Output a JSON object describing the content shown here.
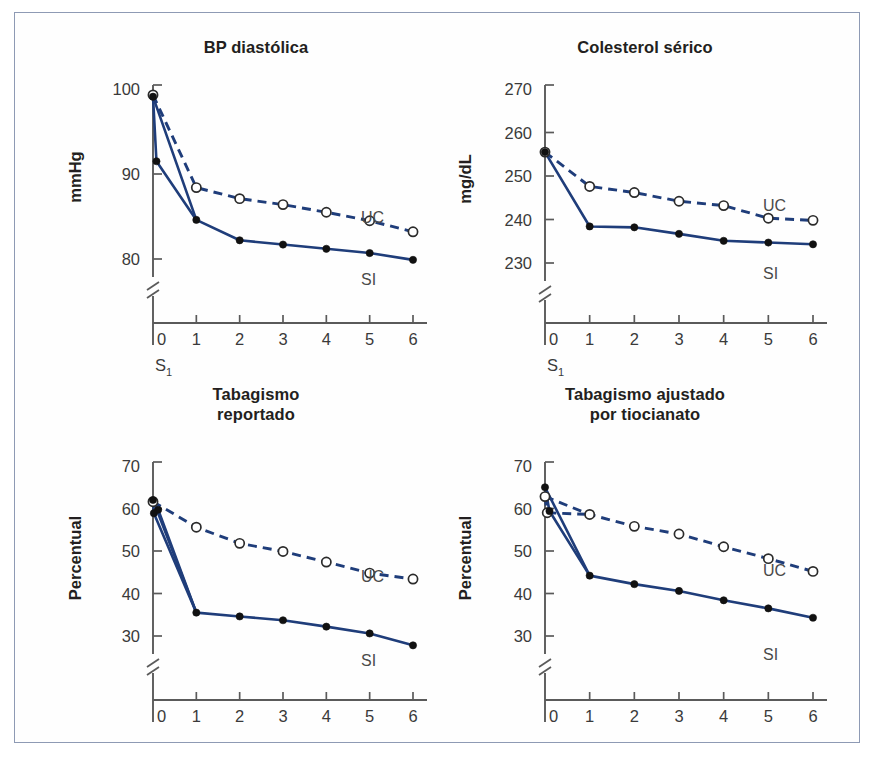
{
  "figure": {
    "background": "#ffffff",
    "border_color": "#8e9ab4",
    "line_color": "#1f3d7a",
    "panels": [
      "top_left",
      "top_right",
      "bottom_left",
      "bottom_right"
    ]
  },
  "chart_data": [
    {
      "id": "bp-diastolica",
      "type": "line",
      "title": "BP diastólica",
      "xlabel": "",
      "ylabel": "mmHg",
      "x": [
        0,
        1,
        2,
        3,
        4,
        5,
        6
      ],
      "xticklabels": [
        "0",
        "1",
        "2",
        "3",
        "4",
        "5",
        "6"
      ],
      "x_origin_note": "S1",
      "yticklabels": [
        "80",
        "90",
        "100"
      ],
      "yticks": [
        80,
        90,
        100
      ],
      "ylim": [
        77,
        101
      ],
      "axis_break": true,
      "grid": false,
      "legend_position": "inline-right",
      "series": [
        {
          "name": "UC",
          "style": "dashed",
          "marker": "open-circle",
          "values": [
            99.3,
            88.4,
            87.1,
            86.4,
            85.5,
            84.5,
            83.2
          ]
        },
        {
          "name": "SI",
          "style": "solid",
          "marker": "filled-circle",
          "values": [
            99.1,
            84.6,
            82.2,
            81.7,
            81.2,
            80.7,
            79.9
          ]
        }
      ],
      "extra_points": [
        {
          "series": "SI",
          "x": 0.08,
          "y": 91.5,
          "marker": "filled-circle"
        }
      ]
    },
    {
      "id": "colesterol-serico",
      "type": "line",
      "title": "Colesterol sérico",
      "xlabel": "",
      "ylabel": "mg/dL",
      "x": [
        0,
        1,
        2,
        3,
        4,
        5,
        6
      ],
      "xticklabels": [
        "0",
        "1",
        "2",
        "3",
        "4",
        "5",
        "6"
      ],
      "x_origin_note": "S1",
      "yticklabels": [
        "230",
        "240",
        "250",
        "260",
        "270"
      ],
      "yticks": [
        230,
        240,
        250,
        260,
        270
      ],
      "ylim": [
        226,
        271
      ],
      "axis_break": true,
      "grid": false,
      "legend_position": "inline-right",
      "series": [
        {
          "name": "UC",
          "style": "dashed",
          "marker": "open-circle",
          "values": [
            255.5,
            247.6,
            246.2,
            244.2,
            243.2,
            240.3,
            239.8
          ]
        },
        {
          "name": "SI",
          "style": "solid",
          "marker": "filled-circle",
          "values": [
            255.5,
            238.4,
            238.2,
            236.7,
            235.1,
            234.7,
            234.3
          ]
        }
      ],
      "extra_points": []
    },
    {
      "id": "tabagismo-reportado",
      "type": "line",
      "title": "Tabagismo\nreportado",
      "title_lines": [
        "Tabagismo",
        "reportado"
      ],
      "xlabel": "",
      "ylabel": "Percentual",
      "x": [
        0,
        1,
        2,
        3,
        4,
        5,
        6
      ],
      "xticklabels": [
        "0",
        "1",
        "2",
        "3",
        "4",
        "5",
        "6"
      ],
      "x_origin_note": "S1",
      "yticklabels": [
        "30",
        "40",
        "50",
        "60",
        "70"
      ],
      "yticks": [
        30,
        40,
        50,
        60,
        70
      ],
      "ylim": [
        26,
        71
      ],
      "axis_break": true,
      "grid": false,
      "legend_position": "inline-right",
      "series": [
        {
          "name": "UC",
          "style": "dashed",
          "marker": "open-circle",
          "values": [
            61.6,
            55.6,
            51.8,
            49.9,
            47.4,
            44.8,
            43.4
          ]
        },
        {
          "name": "SI",
          "style": "solid",
          "marker": "filled-circle",
          "values": [
            62.0,
            35.5,
            34.6,
            33.7,
            32.2,
            30.6,
            27.8
          ]
        }
      ],
      "extra_points": [
        {
          "series": "SI",
          "x": 0.12,
          "y": 59.7,
          "marker": "filled-circle"
        },
        {
          "series": "SI",
          "x": 0.02,
          "y": 58.9,
          "marker": "filled-circle"
        }
      ]
    },
    {
      "id": "tabagismo-ajustado-tiocianato",
      "type": "line",
      "title": "Tabagismo ajustado\npor tiocianato",
      "title_lines": [
        "Tabagismo ajustado",
        "por tiocianato"
      ],
      "xlabel": "",
      "ylabel": "Percentual",
      "x": [
        0,
        1,
        2,
        3,
        4,
        5,
        6
      ],
      "xticklabels": [
        "0",
        "1",
        "2",
        "3",
        "4",
        "5",
        "6"
      ],
      "x_origin_note": "S1",
      "yticklabels": [
        "30",
        "40",
        "50",
        "60",
        "70"
      ],
      "yticks": [
        30,
        40,
        50,
        60,
        70
      ],
      "ylim": [
        26,
        71
      ],
      "axis_break": true,
      "grid": false,
      "legend_position": "inline-right",
      "series": [
        {
          "name": "UC",
          "style": "dashed",
          "marker": "open-circle",
          "values": [
            62.8,
            58.6,
            55.8,
            54.0,
            51.0,
            48.2,
            45.2
          ]
        },
        {
          "name": "SI",
          "style": "solid",
          "marker": "filled-circle",
          "values": [
            65.0,
            44.2,
            42.2,
            40.6,
            38.4,
            36.5,
            34.3
          ]
        }
      ],
      "extra_points": [
        {
          "series": "UC",
          "x": 0.05,
          "y": 59.0,
          "marker": "open-circle"
        },
        {
          "series": "SI",
          "x": 0.1,
          "y": 59.4,
          "marker": "filled-circle"
        }
      ]
    }
  ]
}
